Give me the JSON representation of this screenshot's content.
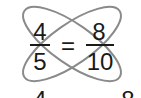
{
  "fraction_left": {
    "numerator": "4",
    "denominator": "5"
  },
  "equals": "=",
  "fraction_right": {
    "numerator": "8",
    "denominator": "10"
  },
  "bottom_partial": {
    "left": "4",
    "right": "8"
  },
  "colors": {
    "ellipse": "#8a8a8a",
    "text": "#1a1a1a",
    "background": "#ffffff"
  }
}
